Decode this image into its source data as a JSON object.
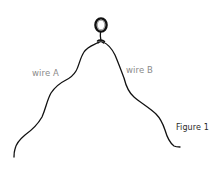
{
  "figure": {
    "caption": "Figure 1",
    "labels": {
      "wire_a": "wire A",
      "wire_b": "wire B"
    },
    "elements": {
      "ring": "ring",
      "knot": "knot",
      "wire_a": "wire A",
      "wire_b": "wire B"
    }
  },
  "colors": {
    "wire": "#111111",
    "label": "#8a8a8a",
    "caption": "#2a2a2a",
    "background": "#ffffff"
  }
}
